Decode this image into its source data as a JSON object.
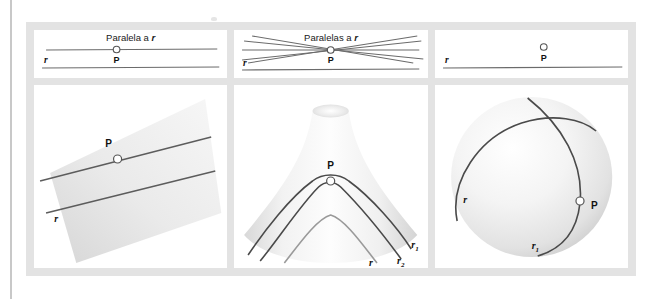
{
  "figure": {
    "panels": [
      {
        "id": "euclidean",
        "top_caption_prefix": "Paralela a ",
        "top_caption_var": "r",
        "labels": {
          "point": "P",
          "line": "r"
        },
        "surface": "plane",
        "parallels_through_p": 1
      },
      {
        "id": "hyperbolic",
        "top_caption_prefix": "Paralelas a ",
        "top_caption_var": "r",
        "labels": {
          "point": "P",
          "line": "r",
          "line1": "r",
          "line1_sub": "1",
          "line2": "r",
          "line2_sub": "2"
        },
        "surface": "saddle",
        "parallels_through_p": "infinite"
      },
      {
        "id": "spherical",
        "top_caption_prefix": "",
        "top_caption_var": "",
        "labels": {
          "point": "P",
          "line": "r",
          "line1": "r",
          "line1_sub": "1"
        },
        "surface": "sphere",
        "parallels_through_p": 0
      }
    ],
    "colors": {
      "frame": "#e3e3e3",
      "cell": "#ffffff",
      "line": "#6b6b6b",
      "curve_dark": "#4a4a4a",
      "curve_light": "#9a9a9a",
      "surface_light": "#f4f4f4",
      "surface_mid": "#d9d9d9",
      "label": "#111111",
      "rule": "#c8c8c8"
    }
  }
}
